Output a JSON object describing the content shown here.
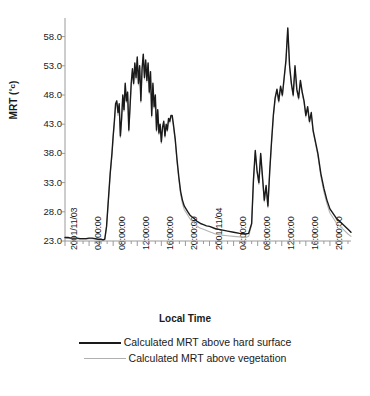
{
  "chart_data": {
    "type": "line",
    "title": "",
    "xlabel": "Local Time",
    "ylabel": "MRT (°c)",
    "ylim": [
      23.0,
      60.5
    ],
    "yticks": [
      "23.0",
      "28.0",
      "33.0",
      "38.0",
      "43.0",
      "48.0",
      "53.0",
      "58.0"
    ],
    "ytick_values": [
      23.0,
      28.0,
      33.0,
      38.0,
      43.0,
      48.0,
      53.0,
      58.0
    ],
    "xticks": [
      "2001/11/03",
      "04:00:00",
      "08:00:00",
      "12:00:00",
      "16:00:00",
      "20:00:00",
      "2001/11/04",
      "04:00:00",
      "08:00:00",
      "12:00:00",
      "16:00:00",
      "20:00:00"
    ],
    "xtick_hours": [
      0,
      4,
      8,
      12,
      16,
      20,
      24,
      28,
      32,
      36,
      40,
      44
    ],
    "x_range_hours": [
      0,
      47.5
    ],
    "grid": false,
    "legend_position": "below",
    "series": [
      {
        "name": "Calculated MRT above hard surface",
        "color": "#1a1a1a",
        "width": 1.4,
        "x": [
          0.0,
          0.5,
          1.0,
          1.5,
          2.0,
          2.5,
          3.0,
          3.5,
          4.0,
          4.5,
          5.0,
          5.5,
          6.0,
          6.3,
          6.6,
          6.9,
          7.2,
          7.5,
          7.8,
          8.0,
          8.2,
          8.4,
          8.6,
          8.8,
          9.0,
          9.2,
          9.4,
          9.6,
          9.8,
          10.0,
          10.2,
          10.4,
          10.6,
          10.8,
          11.0,
          11.2,
          11.4,
          11.6,
          11.8,
          12.0,
          12.2,
          12.4,
          12.6,
          12.8,
          13.0,
          13.2,
          13.4,
          13.6,
          13.8,
          14.0,
          14.2,
          14.4,
          14.6,
          14.8,
          15.0,
          15.2,
          15.4,
          15.6,
          15.8,
          16.0,
          16.2,
          16.4,
          16.6,
          16.8,
          17.0,
          17.2,
          17.4,
          17.6,
          17.8,
          18.0,
          18.3,
          18.6,
          18.9,
          19.2,
          19.5,
          19.8,
          20.1,
          20.4,
          20.7,
          21.0,
          21.5,
          22.0,
          22.5,
          23.0,
          23.5,
          24.0,
          25.0,
          26.0,
          27.0,
          28.0,
          29.0,
          30.0,
          30.5,
          31.0,
          31.3,
          31.6,
          31.9,
          32.2,
          32.5,
          32.8,
          33.1,
          33.4,
          33.7,
          34.0,
          34.3,
          34.6,
          34.9,
          35.2,
          35.5,
          35.8,
          36.1,
          36.4,
          36.7,
          37.0,
          37.3,
          37.6,
          37.9,
          38.2,
          38.5,
          38.8,
          39.1,
          39.4,
          39.7,
          40.0,
          40.3,
          40.6,
          40.9,
          41.2,
          41.5,
          42.0,
          42.5,
          43.0,
          43.5,
          44.0,
          45.0,
          46.0,
          47.0,
          47.5
        ],
        "y": [
          23.6,
          23.6,
          23.5,
          23.5,
          23.5,
          23.4,
          23.4,
          23.4,
          23.5,
          23.5,
          23.4,
          23.3,
          23.3,
          23.2,
          23.3,
          25.5,
          30.0,
          34.5,
          38.0,
          41.0,
          43.5,
          46.5,
          47.0,
          45.0,
          46.5,
          41.0,
          44.0,
          48.0,
          45.5,
          50.0,
          47.0,
          48.5,
          42.0,
          46.0,
          50.0,
          52.5,
          50.0,
          53.5,
          51.0,
          54.5,
          50.0,
          53.0,
          47.0,
          52.5,
          55.0,
          51.0,
          54.0,
          50.5,
          53.5,
          48.5,
          52.0,
          44.5,
          50.0,
          46.0,
          48.0,
          42.0,
          45.5,
          41.5,
          43.0,
          40.0,
          42.5,
          43.5,
          41.0,
          43.0,
          42.0,
          44.0,
          43.5,
          44.5,
          44.5,
          43.0,
          40.5,
          37.0,
          34.0,
          31.5,
          30.0,
          29.0,
          28.5,
          28.0,
          27.5,
          27.2,
          26.8,
          26.3,
          26.0,
          25.8,
          25.6,
          25.5,
          25.1,
          24.9,
          24.7,
          24.5,
          24.3,
          24.2,
          24.3,
          26.0,
          33.5,
          38.5,
          35.0,
          33.0,
          38.0,
          34.0,
          30.0,
          32.5,
          29.0,
          35.0,
          40.0,
          44.5,
          47.5,
          49.0,
          47.0,
          49.5,
          48.0,
          51.0,
          54.0,
          59.5,
          53.0,
          50.0,
          48.0,
          53.0,
          49.0,
          47.5,
          50.5,
          48.5,
          47.0,
          44.5,
          46.0,
          43.5,
          45.0,
          42.0,
          40.5,
          38.0,
          34.5,
          32.0,
          30.0,
          28.5,
          27.0,
          26.0,
          25.0,
          24.5
        ]
      },
      {
        "name": "Calculated MRT above vegetation",
        "color": "#b4b4b4",
        "width": 1.1,
        "x": [
          0.0,
          0.5,
          1.0,
          1.5,
          2.0,
          2.5,
          3.0,
          3.5,
          4.0,
          4.5,
          5.0,
          5.5,
          6.0,
          6.3,
          6.6,
          6.9,
          7.2,
          7.5,
          7.8,
          8.0,
          8.2,
          8.4,
          8.6,
          8.8,
          9.0,
          9.2,
          9.4,
          9.6,
          9.8,
          10.0,
          10.2,
          10.4,
          10.6,
          10.8,
          11.0,
          11.2,
          11.4,
          11.6,
          11.8,
          12.0,
          12.2,
          12.4,
          12.6,
          12.8,
          13.0,
          13.2,
          13.4,
          13.6,
          13.8,
          14.0,
          14.2,
          14.4,
          14.6,
          14.8,
          15.0,
          15.2,
          15.4,
          15.6,
          15.8,
          16.0,
          16.2,
          16.4,
          16.6,
          16.8,
          17.0,
          17.2,
          17.4,
          17.6,
          17.8,
          18.0,
          18.3,
          18.6,
          18.9,
          19.2,
          19.5,
          19.8,
          20.1,
          20.4,
          20.7,
          21.0,
          21.5,
          22.0,
          22.5,
          23.0,
          23.5,
          24.0,
          25.0,
          26.0,
          27.0,
          28.0,
          29.0,
          30.0,
          30.5,
          31.0,
          31.3,
          31.6,
          31.9,
          32.2,
          32.5,
          32.8,
          33.1,
          33.4,
          33.7,
          34.0,
          34.3,
          34.6,
          34.9,
          35.2,
          35.5,
          35.8,
          36.1,
          36.4,
          36.7,
          37.0,
          37.3,
          37.6,
          37.9,
          38.2,
          38.5,
          38.8,
          39.1,
          39.4,
          39.7,
          40.0,
          40.3,
          40.6,
          40.9,
          41.2,
          41.5,
          42.0,
          42.5,
          43.0,
          43.5,
          44.0,
          45.0,
          46.0,
          47.0,
          47.5
        ],
        "y": [
          23.5,
          23.5,
          23.4,
          23.4,
          23.4,
          23.3,
          23.3,
          23.3,
          23.4,
          23.4,
          23.3,
          23.2,
          23.2,
          23.1,
          23.2,
          25.4,
          29.8,
          34.3,
          37.8,
          40.7,
          43.2,
          46.2,
          46.7,
          44.5,
          46.2,
          40.7,
          43.7,
          47.7,
          45.2,
          49.7,
          46.7,
          48.2,
          41.7,
          45.7,
          49.7,
          52.2,
          49.7,
          53.2,
          50.7,
          54.2,
          49.7,
          52.7,
          46.7,
          52.2,
          54.7,
          50.7,
          53.7,
          50.2,
          53.2,
          48.2,
          51.7,
          44.2,
          49.7,
          45.7,
          47.7,
          41.7,
          45.2,
          41.2,
          42.7,
          39.7,
          42.2,
          43.2,
          40.7,
          42.7,
          41.7,
          43.7,
          43.2,
          44.2,
          44.2,
          42.7,
          40.2,
          36.6,
          33.6,
          31.0,
          29.4,
          28.4,
          27.9,
          27.4,
          26.9,
          26.5,
          26.0,
          25.5,
          25.2,
          25.0,
          24.8,
          24.6,
          24.2,
          24.0,
          23.9,
          23.8,
          23.7,
          23.6,
          23.8,
          25.8,
          33.2,
          38.2,
          34.7,
          32.7,
          37.7,
          33.7,
          29.7,
          32.2,
          28.7,
          34.7,
          39.7,
          44.2,
          47.2,
          48.7,
          46.7,
          49.2,
          47.7,
          50.7,
          53.7,
          59.2,
          52.7,
          49.7,
          47.7,
          52.7,
          48.7,
          47.2,
          50.2,
          48.2,
          46.7,
          44.2,
          45.7,
          43.2,
          44.7,
          41.7,
          40.2,
          37.6,
          34.0,
          31.4,
          29.4,
          27.8,
          26.2,
          25.2,
          24.2,
          23.8
        ]
      }
    ]
  },
  "axes": {
    "y_title": "MRT (",
    "y_title_unit": "°c",
    "y_title_close": ")",
    "x_title": "Local Time"
  },
  "legend": {
    "entries": [
      {
        "label": "Calculated MRT above hard surface",
        "style": "hard"
      },
      {
        "label": "Calculated MRT above vegetation",
        "style": "veg"
      }
    ]
  }
}
